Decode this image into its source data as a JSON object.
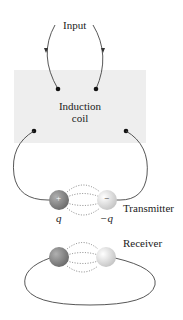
{
  "labels": {
    "input": "Input",
    "induction_coil_line1": "Induction",
    "induction_coil_line2": "coil",
    "transmitter": "Transmitter",
    "receiver": "Receiver",
    "charge_positive": "q",
    "charge_negative": "−q",
    "plus_sign": "+",
    "minus_sign": "−"
  },
  "colors": {
    "coil_box": "#eeeeee",
    "wire": "#444444",
    "positive_sphere": "#8a8a8a",
    "negative_sphere": "#e0e0e0"
  }
}
